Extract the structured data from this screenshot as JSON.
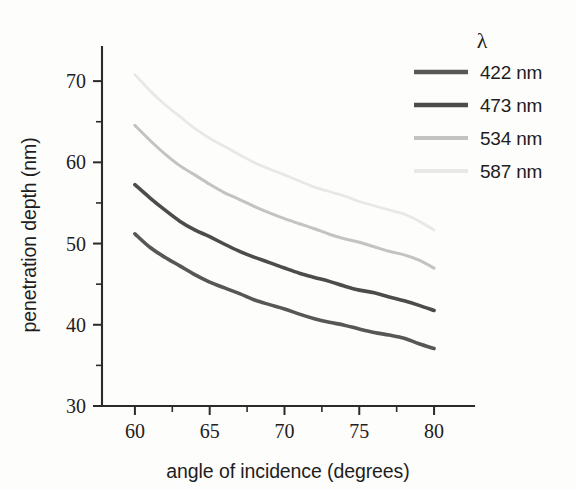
{
  "figure": {
    "background_color": "#ffffff",
    "ink_color": "#231f20"
  },
  "chart_data": {
    "type": "line",
    "title": "",
    "subtitle": "",
    "xlabel": "angle of incidence (degrees)",
    "ylabel": "penetration depth (nm)",
    "xlim": [
      57.8,
      81.2
    ],
    "ylim": [
      30,
      74.2
    ],
    "xticks": [
      60,
      65,
      70,
      75,
      80
    ],
    "xtick_labels": [
      "60",
      "65",
      "70",
      "75",
      "80"
    ],
    "xticks_minor": [
      62.5,
      67.5,
      72.5,
      77.5
    ],
    "yticks": [
      30,
      40,
      50,
      60,
      70
    ],
    "ytick_labels": [
      "30",
      "40",
      "50",
      "60",
      "70"
    ],
    "yticks_minor": [
      35,
      45,
      55,
      65,
      75
    ],
    "grid": false,
    "legend_position": "upper right",
    "legend_title": "λ",
    "x": [
      60,
      61,
      62,
      63,
      64,
      65,
      66,
      67,
      68,
      69,
      70,
      71,
      72,
      73,
      74,
      75,
      76,
      77,
      78,
      79,
      80
    ],
    "series": [
      {
        "name": "422 nm",
        "label": "422 nm",
        "color": "#575757",
        "linewidth": 3.6,
        "values": [
          51.2,
          49.6,
          48.3,
          47.2,
          46.2,
          45.3,
          44.5,
          43.8,
          43.1,
          42.5,
          41.9,
          41.3,
          40.8,
          40.3,
          39.9,
          39.5,
          39.1,
          38.7,
          38.3,
          37.7,
          37.1
        ]
      },
      {
        "name": "473 nm",
        "label": "473 nm",
        "color": "#4c4c4c",
        "linewidth": 3.6,
        "values": [
          57.3,
          55.6,
          54.1,
          52.8,
          51.7,
          50.8,
          49.9,
          49.1,
          48.3,
          47.6,
          47.0,
          46.4,
          45.8,
          45.3,
          44.8,
          44.3,
          43.9,
          43.4,
          43.0,
          42.4,
          41.7
        ]
      },
      {
        "name": "534 nm",
        "label": "534 nm",
        "color": "#c3c3c3",
        "linewidth": 3.0,
        "values": [
          64.5,
          62.7,
          61.1,
          59.6,
          58.4,
          57.3,
          56.3,
          55.4,
          54.5,
          53.8,
          53.1,
          52.4,
          51.8,
          51.2,
          50.6,
          50.1,
          49.6,
          49.1,
          48.6,
          47.9,
          47.0
        ]
      },
      {
        "name": "587 nm",
        "label": "587 nm",
        "color": "#e8e8e8",
        "linewidth": 2.8,
        "values": [
          70.8,
          68.9,
          67.1,
          65.6,
          64.2,
          63.0,
          61.9,
          60.9,
          60.0,
          59.2,
          58.4,
          57.7,
          57.0,
          56.4,
          55.8,
          55.2,
          54.7,
          54.1,
          53.6,
          52.8,
          51.7
        ]
      }
    ]
  }
}
